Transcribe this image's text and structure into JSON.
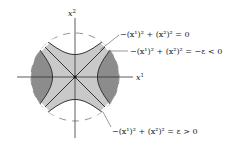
{
  "figure": {
    "axes": {
      "x_label": "x",
      "x_label_sup": "1",
      "y_label": "x",
      "y_label_sup": "2"
    },
    "annotations": [
      {
        "id": "null-cone",
        "text": "−(x¹)² + (x²)² = 0"
      },
      {
        "id": "negative-level",
        "text": "−(x¹)² + (x²)² = −ε < 0"
      },
      {
        "id": "positive-level",
        "text": "−(x¹)² + (x²)² = ε > 0"
      }
    ],
    "colors": {
      "light_region": "#c9c9c9",
      "dark_region": "#8c8c8c",
      "lines": "#333333",
      "dashed_circle": "#777777"
    }
  }
}
